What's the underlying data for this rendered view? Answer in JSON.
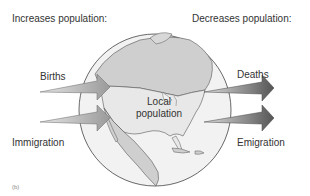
{
  "diagram": {
    "headings": {
      "left": "Increases population:",
      "right": "Decreases population:"
    },
    "center_label": {
      "line1": "Local",
      "line2": "population"
    },
    "inflows": [
      {
        "label": "Births"
      },
      {
        "label": "Immigration"
      }
    ],
    "outflows": [
      {
        "label": "Deaths"
      },
      {
        "label": "Emigration"
      }
    ],
    "panel_label": "(b)",
    "colors": {
      "globe_fill": "#f2f2f2",
      "land_fill": "#cfcfcf",
      "outline": "#444444",
      "arrow_light": "#d0d0d0",
      "arrow_dark": "#555555"
    }
  }
}
